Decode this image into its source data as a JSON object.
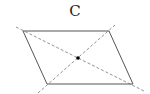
{
  "figure": {
    "label": "C",
    "shape": "parallelogram",
    "vertices": [
      [
        23,
        31
      ],
      [
        109,
        31
      ],
      [
        133,
        84
      ],
      [
        47,
        84
      ]
    ],
    "diagonals": [
      [
        [
          16,
          27
        ],
        [
          144,
          91
        ]
      ],
      [
        [
          38,
          93
        ],
        [
          115,
          25
        ]
      ]
    ],
    "center": [
      78,
      58
    ],
    "colors": {
      "edge": "#555555",
      "diagonal": "#777777",
      "center": "#000000"
    }
  }
}
